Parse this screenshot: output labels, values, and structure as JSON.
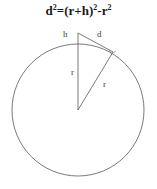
{
  "figure": {
    "title_formula": "d²=(r+h)²-r²",
    "formula_parts": {
      "lhs_base": "d",
      "lhs_exp": "2",
      "equals": "=",
      "term1_base": "(r+h)",
      "term1_exp": "2",
      "minus": "-",
      "term2_base": "r",
      "term2_exp": "2"
    },
    "labels": {
      "height": "h",
      "distance": "d",
      "radius_vertical": "r",
      "radius_diagonal": "r"
    },
    "geometry": {
      "circle": {
        "cx": 78,
        "cy": 110,
        "r": 66
      },
      "apex_point": {
        "x": 78,
        "y": 33
      },
      "center_point": {
        "x": 78,
        "y": 110
      },
      "tangent_point": {
        "x": 113,
        "y": 52
      },
      "circle_top_point": {
        "x": 78,
        "y": 44
      }
    },
    "colors": {
      "stroke": "#6b6b6b",
      "text": "#3a3a3a",
      "formula_text": "#1a1a1a",
      "background": "#ffffff"
    }
  }
}
